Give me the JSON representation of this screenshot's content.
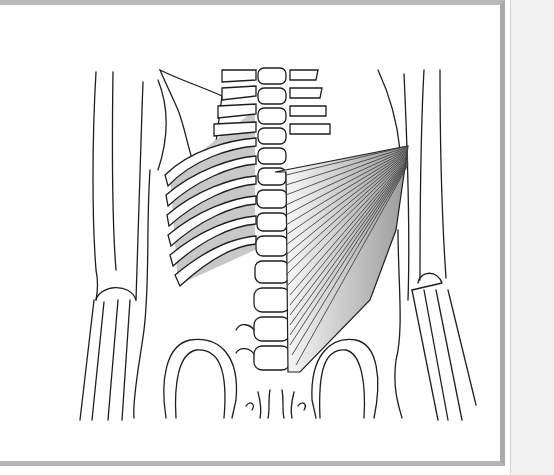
{
  "figure": {
    "view": "posterior",
    "labels": [],
    "colors": {
      "line": "#1e1e1e",
      "muscle_shade": "#a8a8a8",
      "intercostal_shade": "#c8c8c8",
      "frame_border": "#b5b5b5",
      "side_panel": "#f1f1f1"
    }
  }
}
